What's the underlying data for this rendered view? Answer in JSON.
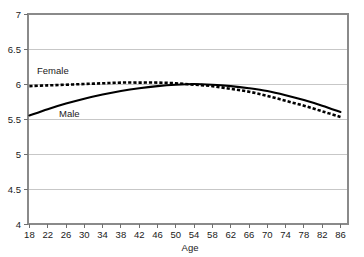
{
  "chart_data": {
    "type": "line",
    "title": "",
    "xlabel": "Age",
    "ylabel": "",
    "xlim": [
      18,
      86
    ],
    "ylim": [
      4,
      7
    ],
    "grid": true,
    "legend_position": "inline-labels",
    "x_ticks": [
      18,
      22,
      26,
      30,
      34,
      38,
      42,
      46,
      50,
      54,
      58,
      62,
      66,
      70,
      74,
      78,
      82,
      86
    ],
    "y_ticks": [
      4,
      4.5,
      5,
      5.5,
      6,
      6.5,
      7
    ],
    "x": [
      18,
      22,
      26,
      30,
      34,
      38,
      42,
      46,
      50,
      54,
      58,
      62,
      66,
      70,
      74,
      78,
      82,
      86
    ],
    "series": [
      {
        "name": "Female",
        "style": "dashed",
        "color": "#000000",
        "values": [
          5.97,
          5.98,
          5.99,
          6.0,
          6.01,
          6.02,
          6.02,
          6.02,
          6.01,
          5.99,
          5.97,
          5.93,
          5.89,
          5.83,
          5.76,
          5.69,
          5.61,
          5.53
        ]
      },
      {
        "name": "Male",
        "style": "solid",
        "color": "#000000",
        "values": [
          5.55,
          5.64,
          5.72,
          5.79,
          5.85,
          5.9,
          5.94,
          5.97,
          5.99,
          6.0,
          5.99,
          5.97,
          5.94,
          5.9,
          5.84,
          5.77,
          5.69,
          5.6
        ]
      }
    ],
    "annotations": [
      {
        "text": "Female",
        "x": 22,
        "y": 6.2
      },
      {
        "text": "Male",
        "x": 30,
        "y": 5.45
      }
    ]
  },
  "axis": {
    "x_title": "Age",
    "x_tick_labels": [
      "18",
      "22",
      "26",
      "30",
      "34",
      "38",
      "42",
      "46",
      "50",
      "54",
      "58",
      "62",
      "66",
      "70",
      "74",
      "78",
      "82",
      "86"
    ],
    "y_tick_labels": [
      "7",
      "6.5",
      "6",
      "5.5",
      "5",
      "4.5",
      "4"
    ]
  },
  "labels": {
    "female": "Female",
    "male": "Male"
  },
  "colors": {
    "line": "#000000",
    "grid": "#b9b9b9",
    "frame": "#8a8a8a",
    "background": "#ffffff",
    "text": "#1a1a1a"
  }
}
